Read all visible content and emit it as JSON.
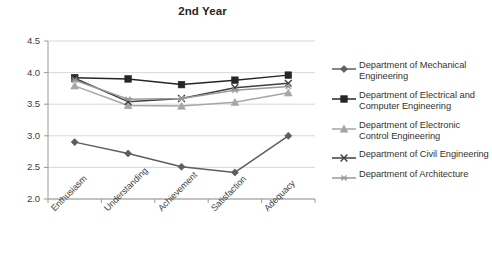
{
  "chart_data": {
    "type": "line",
    "title": "2nd Year",
    "xlabel": "",
    "ylabel": "",
    "ylim": [
      2.0,
      4.5
    ],
    "yticks": [
      "2.0",
      "2.5",
      "3.0",
      "3.5",
      "4.0",
      "4.5"
    ],
    "grid": true,
    "legend_position": "right",
    "categories": [
      "Enthusiasm",
      "Understanding",
      "Achievement",
      "Satisfaction",
      "Adequacy"
    ],
    "series": [
      {
        "name": "Department of Mechanical Engineering",
        "marker": "diamond",
        "color": "#5e5e5e",
        "values": [
          2.9,
          2.72,
          2.51,
          2.42,
          3.0
        ]
      },
      {
        "name": "Department of Electrical and Computer Engineering",
        "marker": "square",
        "color": "#262626",
        "values": [
          3.92,
          3.9,
          3.81,
          3.88,
          3.96
        ]
      },
      {
        "name": "Department of Electronic Control Engineering",
        "marker": "triangle",
        "color": "#a6a6a6",
        "values": [
          3.79,
          3.48,
          3.47,
          3.53,
          3.68
        ]
      },
      {
        "name": "Department of Civil Engineering",
        "marker": "x",
        "color": "#3f3f3f",
        "values": [
          3.91,
          3.54,
          3.59,
          3.76,
          3.83
        ]
      },
      {
        "name": "Department of Architecture",
        "marker": "asterisk",
        "color": "#9a9a9a",
        "values": [
          3.88,
          3.58,
          3.59,
          3.72,
          3.78
        ]
      }
    ]
  },
  "legend": {
    "entries": [
      "Department of Mechanical Engineering",
      "Department of Electrical and Computer Engineering",
      "Department of Electronic Control Engineering",
      "Department of Civil Engineering",
      "Department of Architecture"
    ]
  },
  "axis": {
    "y_min_label": "2.0",
    "y_max_label": "4.5"
  }
}
